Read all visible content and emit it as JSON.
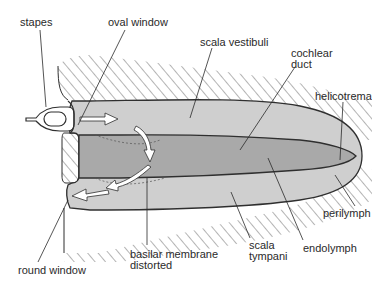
{
  "diagram": {
    "colors": {
      "background": "#ffffff",
      "perilymph_fill": "#cfcfcf",
      "endolymph_fill": "#a9a9a9",
      "outline": "#2f2f2f",
      "hatch": "#6a6a6a",
      "arrow_fill": "#ffffff",
      "label_text": "#2a2a2a"
    },
    "labels": {
      "stapes": "stapes",
      "oval_window": "oval window",
      "scala_vestibuli": "scala vestibuli",
      "cochlear_duct_line1": "cochlear",
      "cochlear_duct_line2": "duct",
      "helicotrema": "helicotrema",
      "perilymph": "perilymph",
      "endolymph": "endolymph",
      "scala_tympani_line1": "scala",
      "scala_tympani_line2": "tympani",
      "basilar_membrane_line1": "basilar membrane",
      "basilar_membrane_line2": "distorted",
      "round_window": "round window"
    },
    "structures": [
      {
        "name": "stapes",
        "type": "bone"
      },
      {
        "name": "oval window",
        "type": "membrane"
      },
      {
        "name": "round window",
        "type": "membrane"
      },
      {
        "name": "scala vestibuli",
        "type": "perilymph-chamber"
      },
      {
        "name": "cochlear duct",
        "type": "endolymph-chamber"
      },
      {
        "name": "scala tympani",
        "type": "perilymph-chamber"
      },
      {
        "name": "helicotrema",
        "type": "connection"
      },
      {
        "name": "basilar membrane",
        "type": "membrane",
        "state": "distorted"
      }
    ],
    "arrows": [
      {
        "id": "arrow-1",
        "direction": "right",
        "meaning": "pressure into scala vestibuli"
      },
      {
        "id": "arrow-2",
        "direction": "down",
        "meaning": "pressure across cochlear duct"
      },
      {
        "id": "arrow-3",
        "direction": "down-left",
        "meaning": "into scala tympani"
      },
      {
        "id": "arrow-4",
        "direction": "left",
        "meaning": "toward round window"
      }
    ]
  }
}
